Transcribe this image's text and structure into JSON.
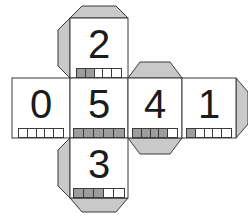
{
  "figure": {
    "kind": "cube-net",
    "background_color": "#ffffff",
    "face_fill_color": "#ffffff",
    "flap_fill_color": "#c9c9c9",
    "outline_color": "#3a3a3a",
    "digit_color": "#1b1b1b",
    "pip_on_color": "#9d9d9d",
    "pip_off_color": "#ffffff",
    "pip_total": 5
  },
  "faces": [
    {
      "id": "face-zero",
      "digit": "0",
      "pips_filled": 0,
      "position": "row-left",
      "x": 12,
      "y": 78,
      "w": 58,
      "h": 60
    },
    {
      "id": "face-two",
      "digit": "2",
      "pips_filled": 2,
      "position": "top",
      "x": 70,
      "y": 18,
      "w": 58,
      "h": 60
    },
    {
      "id": "face-five",
      "digit": "5",
      "pips_filled": 5,
      "position": "row-center-left",
      "x": 70,
      "y": 78,
      "w": 58,
      "h": 60
    },
    {
      "id": "face-four",
      "digit": "4",
      "pips_filled": 4,
      "position": "row-center-right",
      "x": 128,
      "y": 78,
      "w": 54,
      "h": 60
    },
    {
      "id": "face-one",
      "digit": "1",
      "pips_filled": 1,
      "position": "row-right",
      "x": 182,
      "y": 78,
      "w": 54,
      "h": 60
    },
    {
      "id": "face-three",
      "digit": "3",
      "pips_filled": 3,
      "position": "bottom",
      "x": 70,
      "y": 138,
      "w": 58,
      "h": 60
    }
  ],
  "flaps": [
    {
      "id": "flap-two-top",
      "attached_to": "face-two",
      "side": "top"
    },
    {
      "id": "flap-two-left",
      "attached_to": "face-two",
      "side": "left"
    },
    {
      "id": "flap-four-top",
      "attached_to": "face-four",
      "side": "top"
    },
    {
      "id": "flap-four-bottom",
      "attached_to": "face-four",
      "side": "bottom"
    },
    {
      "id": "flap-one-right",
      "attached_to": "face-one",
      "side": "right"
    },
    {
      "id": "flap-three-left",
      "attached_to": "face-three",
      "side": "left"
    },
    {
      "id": "flap-three-bottom",
      "attached_to": "face-three",
      "side": "bottom"
    }
  ]
}
